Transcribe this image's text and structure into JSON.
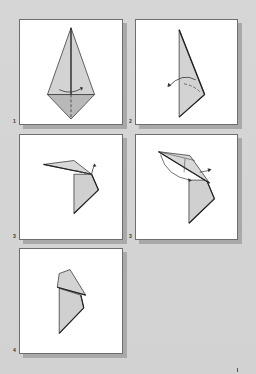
{
  "diagram": {
    "type": "origami-instructions",
    "background_color": "#d4d4d4",
    "paper_fill": "#cfcfcf",
    "paper_fill_dark": "#b9b9b9",
    "line_color": "#3a3a3a",
    "panels": [
      {
        "step": "1",
        "description": "Kite shape with vertical valley fold line and rotation arrow"
      },
      {
        "step": "2",
        "description": "Folded in half, arrow curving left"
      },
      {
        "step": "3",
        "description": "Head section folded out with arrow"
      },
      {
        "step": "3",
        "description": "Reverse fold of head, arrows"
      },
      {
        "step": "4",
        "description": "Finished head shape"
      }
    ]
  }
}
